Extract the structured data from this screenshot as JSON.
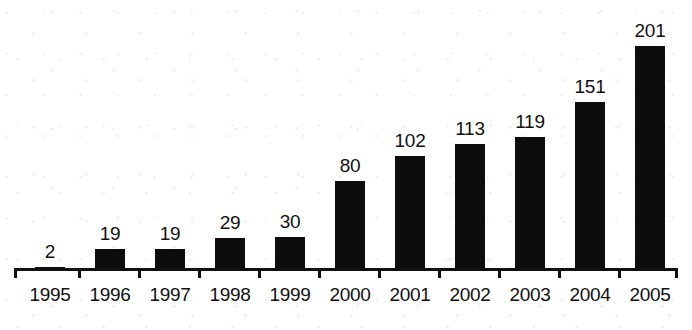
{
  "chart_data": {
    "type": "bar",
    "title": "",
    "subtitle": "",
    "xlabel": "",
    "ylabel": "",
    "categories": [
      "1995",
      "1996",
      "1997",
      "1998",
      "1999",
      "2000",
      "2001",
      "2002",
      "2003",
      "2004",
      "2005"
    ],
    "values": [
      2,
      19,
      19,
      29,
      30,
      80,
      102,
      113,
      119,
      151,
      201
    ],
    "data_labels": [
      "2",
      "19",
      "19",
      "29",
      "30",
      "80",
      "102",
      "113",
      "119",
      "151",
      "201"
    ],
    "ylim": [
      0,
      201
    ],
    "grid": false,
    "legend": null,
    "annotations": [],
    "style": {
      "bar_color": "#0d0d0d",
      "background_color": "#ffffff",
      "axis_color": "#111111",
      "label_color": "#111111",
      "y_axis_visible": false,
      "x_axis_visible": true,
      "ticks_between_categories": true
    }
  }
}
